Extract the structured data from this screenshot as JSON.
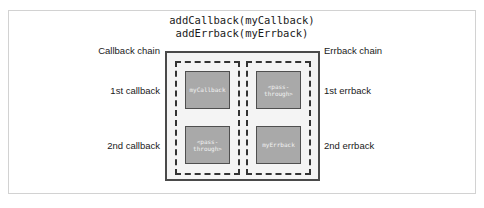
{
  "figure": {
    "title_lines": [
      "addCallback(myCallback)",
      "addErrback(myErrback)"
    ],
    "colors": {
      "page_background": "#ffffff",
      "frame_border": "#d2d2d2",
      "container_border": "#4a4a4a",
      "container_fill": "#f4f4f4",
      "chain_dashed_border": "#333333",
      "handler_fill": "#a9a9a9",
      "handler_border": "#4f4f4f",
      "handler_text": "#f2f2f2",
      "label_text": "#1a1a1a"
    }
  },
  "labels": {
    "callback_chain": "Callback chain",
    "errback_chain": "Errback chain",
    "first_callback": "1st callback",
    "second_callback": "2nd callback",
    "first_errback": "1st errback",
    "second_errback": "2nd errback"
  },
  "chains": {
    "callback": {
      "name": "Callback chain",
      "handlers": [
        {
          "id": "callback-1",
          "lines": [
            "myCallback"
          ]
        },
        {
          "id": "callback-2",
          "lines": [
            "<pass-",
            "through>"
          ]
        }
      ]
    },
    "errback": {
      "name": "Errback chain",
      "handlers": [
        {
          "id": "errback-1",
          "lines": [
            "<pass-",
            "through>"
          ]
        },
        {
          "id": "errback-2",
          "lines": [
            "myErrback"
          ]
        }
      ]
    }
  }
}
